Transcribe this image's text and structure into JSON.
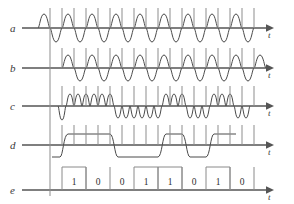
{
  "figure": {
    "type": "signal-timing-diagram",
    "background": "#ffffff",
    "wave_color": "#4a4a4a",
    "axis_color": "#555555",
    "grid_color": "#8d8d8d",
    "width": 294,
    "height": 204
  },
  "rows": [
    {
      "id": "a",
      "label": "a",
      "axis_label": "t",
      "baseline_y": 28,
      "kind": "carrier-sine",
      "description": "continuous sinusoidal carrier with phase reversals"
    },
    {
      "id": "b",
      "label": "b",
      "axis_label": "t",
      "baseline_y": 68,
      "kind": "reference-sine",
      "description": "reference carrier sinusoid"
    },
    {
      "id": "c",
      "label": "c",
      "axis_label": "t",
      "baseline_y": 106,
      "kind": "product-sine",
      "description": "product / multiplied signal, rectified lobes"
    },
    {
      "id": "d",
      "label": "d",
      "axis_label": "t",
      "baseline_y": 145,
      "kind": "filtered-bipolar",
      "description": "low-pass filtered bipolar square wave"
    },
    {
      "id": "e",
      "label": "e",
      "axis_label": "t",
      "baseline_y": 190,
      "kind": "binary-data",
      "description": "recovered binary data stream"
    }
  ],
  "axis": {
    "origin_x": 50,
    "end_x": 270,
    "arrow_label": "t"
  },
  "bit_cells": {
    "start_x": 62,
    "cell_width": 24,
    "count": 8,
    "top_y": 167,
    "values": [
      "1",
      "0",
      "0",
      "1",
      "1",
      "0",
      "1",
      "0"
    ]
  },
  "chart_data": {
    "type": "line",
    "title": "",
    "xlabel": "t",
    "ylabel": "",
    "categories": [
      "a",
      "b",
      "c",
      "d",
      "e"
    ],
    "bits": [
      "1",
      "0",
      "0",
      "1",
      "1",
      "0",
      "1",
      "0"
    ],
    "series": [
      {
        "name": "a",
        "description": "carrier sine, 16 cycles, phase reversals at bit transitions"
      },
      {
        "name": "b",
        "description": "local reference sine, 16 cycles, constant phase"
      },
      {
        "name": "c",
        "description": "product of a and b, lobes above axis for 1, below axis for 0"
      },
      {
        "name": "d",
        "description": "filtered bipolar waveform, high for 1, low for 0"
      },
      {
        "name": "e",
        "description": "regenerated NRZ binary data 1 0 0 1 1 0 1 0"
      }
    ]
  }
}
